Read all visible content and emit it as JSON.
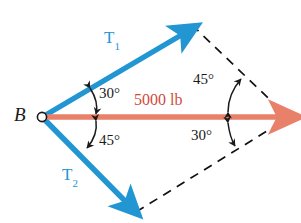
{
  "figure": {
    "background_color": "#ffffff",
    "width": 301,
    "height": 223
  },
  "colors": {
    "vector_blue": "#2196d3",
    "resultant_red": "#e8806a",
    "force_text_red": "#cf4a3c",
    "annotation_black": "#1a1a1a",
    "dashed_black": "#111111"
  },
  "points": {
    "origin": {
      "label": "B",
      "x": 42,
      "y": 117
    },
    "t1_tip": {
      "x": 189,
      "y": 28
    },
    "t2_tip": {
      "x": 133,
      "y": 210
    },
    "resultant_tip": {
      "x": 286,
      "y": 117
    }
  },
  "vectors": [
    {
      "name": "T1",
      "label": "T",
      "subscript": "1",
      "color": "#2196d3",
      "angle_from_resultant_deg": 30,
      "direction": "upper-left to upper-right"
    },
    {
      "name": "T2",
      "label": "T",
      "subscript": "2",
      "color": "#2196d3",
      "angle_from_resultant_deg": 45,
      "direction": "lower-left to lower-right"
    },
    {
      "name": "resultant",
      "label": "5000 lb",
      "magnitude": 5000,
      "unit": "lb",
      "color": "#e8806a",
      "direction": "horizontal-right"
    }
  ],
  "angles": [
    {
      "id": "angle-30-left",
      "value": "30°",
      "location": "between T1 and resultant at B"
    },
    {
      "id": "angle-45-left",
      "value": "45°",
      "location": "between resultant and T2 at B"
    },
    {
      "id": "angle-45-right",
      "value": "45°",
      "location": "upper right interior of parallelogram"
    },
    {
      "id": "angle-30-right",
      "value": "30°",
      "location": "lower right interior of parallelogram"
    }
  ],
  "construction_lines": {
    "style": "dashed",
    "segments": [
      {
        "from": "t1_tip",
        "to": "resultant_tip"
      },
      {
        "from": "t2_tip",
        "to": "resultant_tip"
      }
    ]
  }
}
